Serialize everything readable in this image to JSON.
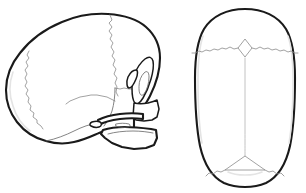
{
  "figure": {
    "title": "Neonatal skull — lateral and superior views",
    "background_color": "#ffffff",
    "outline_color": "#1a1a1a",
    "suture_color": "#8a8a8a",
    "faint_suture_color": "#c2c2c2",
    "shade_color": "#e4e4e4",
    "width": 306,
    "height": 193
  },
  "views": [
    {
      "id": "lateral",
      "name": "lateral-view",
      "label": "Lateral view of neonatal skull",
      "orientation": "facing right",
      "bounds": {
        "x": 4,
        "y": 12,
        "width": 170,
        "height": 136
      },
      "structures": [
        {
          "name": "frontal-bone",
          "label": "Frontal bone"
        },
        {
          "name": "parietal-bone",
          "label": "Parietal bone"
        },
        {
          "name": "occipital-bone",
          "label": "Occipital bone"
        },
        {
          "name": "temporal-squama",
          "label": "Squamous part of temporal bone"
        },
        {
          "name": "greater-wing-sphenoid",
          "label": "Greater wing of sphenoid"
        },
        {
          "name": "orbit",
          "label": "Orbit"
        },
        {
          "name": "zygomatic-arch",
          "label": "Zygomatic arch"
        },
        {
          "name": "maxilla",
          "label": "Maxilla"
        },
        {
          "name": "mandible",
          "label": "Mandible"
        },
        {
          "name": "tympanic-ring",
          "label": "Tympanic ring"
        }
      ],
      "sutures": [
        {
          "name": "coronal-suture",
          "label": "Coronal suture"
        },
        {
          "name": "lambdoid-suture",
          "label": "Lambdoid suture"
        },
        {
          "name": "squamous-suture",
          "label": "Squamous suture"
        }
      ]
    },
    {
      "id": "superior",
      "name": "superior-view",
      "label": "Superior (vertex) view of neonatal skull",
      "orientation": "anterior at top",
      "bounds": {
        "x": 196,
        "y": 8,
        "width": 98,
        "height": 178
      },
      "structures": [
        {
          "name": "frontal-bone",
          "label": "Frontal bone"
        },
        {
          "name": "parietal-bone-left",
          "label": "Left parietal bone"
        },
        {
          "name": "parietal-bone-right",
          "label": "Right parietal bone"
        },
        {
          "name": "occipital-bone",
          "label": "Occipital bone"
        }
      ],
      "sutures": [
        {
          "name": "coronal-suture",
          "label": "Coronal suture"
        },
        {
          "name": "sagittal-suture",
          "label": "Sagittal suture"
        },
        {
          "name": "lambdoid-suture",
          "label": "Lambdoid suture"
        }
      ],
      "fontanelles": [
        {
          "name": "anterior-fontanelle",
          "label": "Anterior fontanelle",
          "shape": "diamond"
        },
        {
          "name": "posterior-fontanelle",
          "label": "Posterior fontanelle",
          "shape": "triangle"
        }
      ]
    }
  ]
}
